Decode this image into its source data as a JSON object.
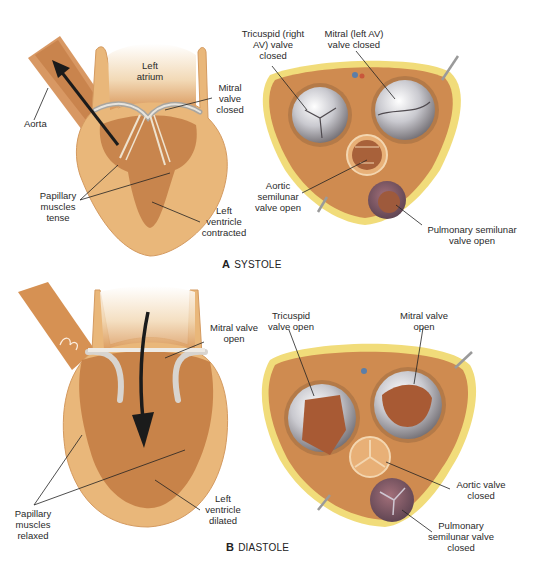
{
  "figure": {
    "panels": [
      {
        "id": "A",
        "letter": "A",
        "title": "SYSTOLE",
        "longitudinal_labels": {
          "aorta": "Aorta",
          "left_atrium": "Left atrium",
          "mitral_valve": "Mitral valve closed",
          "papillary": "Papillary muscles tense",
          "left_ventricle": "Left ventricle contracted"
        },
        "cross_section_labels": {
          "tricuspid": "Tricuspid (right AV) valve closed",
          "mitral": "Mitral (left AV) valve closed",
          "aortic": "Aortic semilunar valve open",
          "pulmonary": "Pulmonary semilunar valve open"
        }
      },
      {
        "id": "B",
        "letter": "B",
        "title": "DIASTOLE",
        "longitudinal_labels": {
          "mitral_valve": "Mitral valve open",
          "papillary": "Papillary muscles relaxed",
          "left_ventricle": "Left ventricle dilated"
        },
        "cross_section_labels": {
          "tricuspid": "Tricuspid valve open",
          "mitral": "Mitral valve open",
          "aortic": "Aortic valve closed",
          "pulmonary": "Pulmonary semilunar valve closed"
        }
      }
    ],
    "colors": {
      "tissue_light": "#e9b77a",
      "tissue_mid": "#d9975a",
      "tissue_dark": "#b8703f",
      "fat": "#f1dc7a",
      "valve_silver": "#cfcfd4",
      "arrow": "#1b1b1b"
    }
  }
}
